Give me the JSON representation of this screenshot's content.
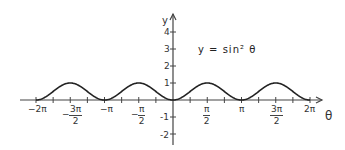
{
  "chart_data": {
    "type": "line",
    "title": "y = sin² θ",
    "xlabel": "θ",
    "ylabel": "y",
    "xlim": [
      -6.2832,
      6.2832
    ],
    "ylim": [
      -2,
      4
    ],
    "grid": false,
    "x_ticks": [
      {
        "value": -6.2832,
        "label": "−2π"
      },
      {
        "value": -4.7124,
        "label_num": "3π",
        "label_den": "2",
        "sign": "−"
      },
      {
        "value": -3.1416,
        "label": "−π"
      },
      {
        "value": -1.5708,
        "label_num": "π",
        "label_den": "2",
        "sign": "−"
      },
      {
        "value": 1.5708,
        "label_num": "π",
        "label_den": "2",
        "sign": ""
      },
      {
        "value": 3.1416,
        "label": "π"
      },
      {
        "value": 4.7124,
        "label_num": "3π",
        "label_den": "2",
        "sign": ""
      },
      {
        "value": 6.2832,
        "label": "2π"
      }
    ],
    "y_ticks": [
      -2,
      -1,
      1,
      2,
      3,
      4
    ],
    "y_tick_labels": [
      "-2",
      "-1",
      "1",
      "2",
      "3",
      "4"
    ],
    "series": [
      {
        "name": "y = sin² θ",
        "x": [
          -6.2832,
          -5.4978,
          -4.7124,
          -3.927,
          -3.1416,
          -2.3562,
          -1.5708,
          -0.7854,
          0,
          0.7854,
          1.5708,
          2.3562,
          3.1416,
          3.927,
          4.7124,
          5.4978,
          6.2832
        ],
        "values": [
          0,
          0.5,
          1,
          0.5,
          0,
          0.5,
          1,
          0.5,
          0,
          0.5,
          1,
          0.5,
          0,
          0.5,
          1,
          0.5,
          0
        ]
      }
    ]
  },
  "labels": {
    "title": "y = sin² θ",
    "x_axis": "θ",
    "y_axis": "y",
    "neg2pi": "−2π",
    "negpi": "−π",
    "pi": "π",
    "twopi": "2π",
    "minus": "−",
    "num_3pi": "3π",
    "num_pi": "π",
    "den_2": "2",
    "y4": "4",
    "y3": "3",
    "y2": "2",
    "y1": "1",
    "ym1": "-1",
    "ym2": "-2"
  },
  "colors": {
    "axis": "#444444",
    "curve": "#222222",
    "text": "#333333"
  }
}
